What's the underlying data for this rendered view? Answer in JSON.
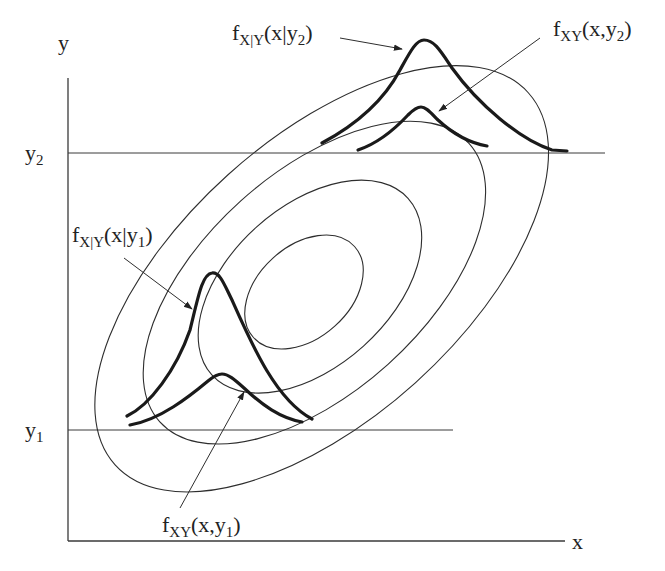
{
  "figure": {
    "axes": {
      "x_label": "x",
      "y_label": "y"
    },
    "levels": {
      "y1": {
        "base": "y",
        "sub": "1"
      },
      "y2": {
        "base": "y",
        "sub": "2"
      }
    },
    "annotations": {
      "cond_y2": {
        "f": "f",
        "sub": "X|Y",
        "args_pre": "(x|y",
        "args_sub": "2",
        "args_post": ")"
      },
      "joint_y2": {
        "f": "f",
        "sub": "XY",
        "args_pre": "(x,y",
        "args_sub": "2",
        "args_post": ")"
      },
      "cond_y1": {
        "f": "f",
        "sub": "X|Y",
        "args_pre": "(x|y",
        "args_sub": "1",
        "args_post": ")"
      },
      "joint_y1": {
        "f": "f",
        "sub": "XY",
        "args_pre": "(x,y",
        "args_sub": "1",
        "args_post": ")"
      }
    },
    "colors": {
      "line": "#2e2e2e",
      "curve": "#1a1a1a",
      "background": "#ffffff"
    }
  }
}
